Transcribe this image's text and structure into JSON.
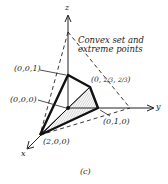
{
  "diagram": {
    "caption": "(c)",
    "title_line1": "Convex set and",
    "title_line2": "extreme points",
    "axes": {
      "x": "x",
      "y": "y",
      "z": "z"
    },
    "points": [
      {
        "label": "(0,0,1)"
      },
      {
        "label": "(0,0,0)"
      },
      {
        "label": "(0,",
        "frac1": "2/3",
        "frac2": "2/3",
        "close": ")"
      },
      {
        "label": "(0,1,0)"
      },
      {
        "label": "(2,0,0)"
      }
    ],
    "colors": {
      "ink": "#1a1a1a",
      "shade": "#b8b8b8"
    }
  }
}
